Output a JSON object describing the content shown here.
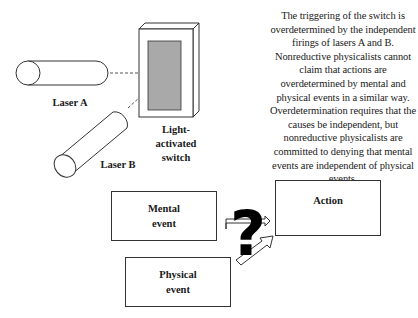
{
  "top_diagram": {
    "laser_a_label": "Laser A",
    "laser_b_label": "Laser B",
    "switch_label": "Light-\nactivated\nswitch"
  },
  "caption": "The triggering of the switch is overdetermined by the independent firings of lasers A and B. Nonreductive physicalists cannot claim that actions are overdetermined by mental and physical events in a similar way. Overdetermination requires that the causes be independent, but nonreductive physicalists are committed to denying that mental events are independent of physical events.",
  "bottom_diagram": {
    "mental_event_label": "Mental\nevent",
    "physical_event_label": "Physical\nevent",
    "action_label": "Action",
    "question_mark": "?"
  }
}
